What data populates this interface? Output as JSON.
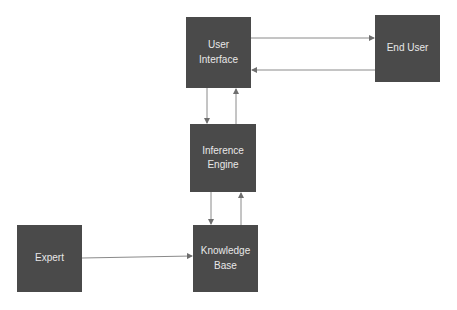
{
  "diagram": {
    "type": "expert-system-architecture",
    "colors": {
      "box_fill": "#4a4a4a",
      "box_text": "#e8e8e8",
      "arrow": "#8a8a8a",
      "background": "#ffffff"
    },
    "nodes": [
      {
        "id": "user_interface",
        "label": "User\nInterface",
        "x": 186,
        "y": 17,
        "w": 65,
        "h": 71
      },
      {
        "id": "end_user",
        "label": "End User",
        "x": 375,
        "y": 15,
        "w": 65,
        "h": 67
      },
      {
        "id": "inference_engine",
        "label": "Inference\nEngine",
        "x": 190,
        "y": 124,
        "w": 66,
        "h": 68
      },
      {
        "id": "expert",
        "label": "Expert",
        "x": 17,
        "y": 225,
        "w": 65,
        "h": 67
      },
      {
        "id": "knowledge_base",
        "label": "Knowledge\nBase",
        "x": 193,
        "y": 225,
        "w": 65,
        "h": 67
      }
    ],
    "edges": [
      {
        "from": "user_interface",
        "to": "end_user"
      },
      {
        "from": "end_user",
        "to": "user_interface"
      },
      {
        "from": "user_interface",
        "to": "inference_engine"
      },
      {
        "from": "inference_engine",
        "to": "user_interface"
      },
      {
        "from": "inference_engine",
        "to": "knowledge_base"
      },
      {
        "from": "knowledge_base",
        "to": "inference_engine"
      },
      {
        "from": "expert",
        "to": "knowledge_base"
      }
    ]
  }
}
